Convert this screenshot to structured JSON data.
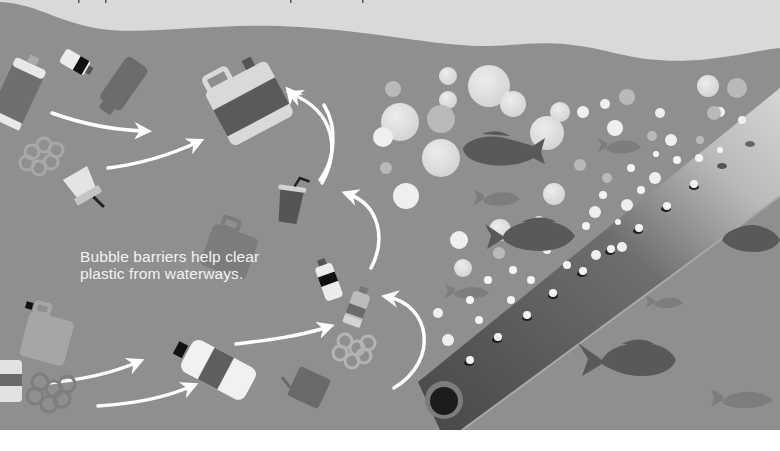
{
  "caption": {
    "line1": "Bubble barriers help clear",
    "line2": "plastic from waterways."
  },
  "colors": {
    "sky": "#d9d9d9",
    "water": "#8f8f8f",
    "pipe_dark": "#4a4a4a",
    "pipe_light": "#c8c8c8",
    "fish_dark": "#5a5a5a",
    "fish_faint": "#7f7f7f",
    "arrow": "#ffffff",
    "bubble": "#e6e6e6",
    "text": "#f2f2f2"
  },
  "illustration": {
    "subject": "bubble barrier pipe releasing air bubbles",
    "elements": [
      "plastic-bottles",
      "jerry-cans",
      "six-pack-rings",
      "drink-cups",
      "fish",
      "bubbles",
      "flow-arrows",
      "perforated-pipe"
    ]
  }
}
